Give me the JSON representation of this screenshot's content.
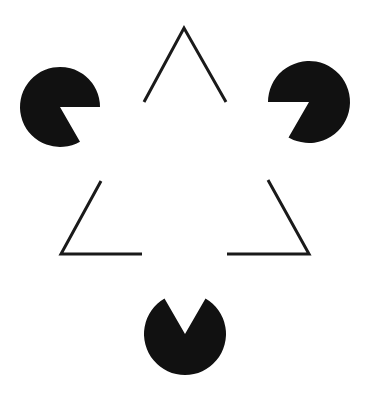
{
  "figure": {
    "background": "#ffffff",
    "foreground": "#111111",
    "pacmen": [
      {
        "name": "left-pacman",
        "cx": 60,
        "cy": 107,
        "r": 40,
        "mouth_start_deg": 0,
        "mouth_end_deg": 60
      },
      {
        "name": "right-pacman",
        "cx": 309,
        "cy": 102,
        "r": 41,
        "mouth_start_deg": 120,
        "mouth_end_deg": 180
      },
      {
        "name": "bottom-pacman",
        "cx": 185,
        "cy": 334,
        "r": 41,
        "mouth_start_deg": 240,
        "mouth_end_deg": 300
      }
    ],
    "outline_corners": [
      {
        "name": "top-corner",
        "points": [
          [
            144,
            102
          ],
          [
            184,
            28
          ],
          [
            226,
            102
          ]
        ]
      },
      {
        "name": "left-corner",
        "points": [
          [
            101,
            181
          ],
          [
            61,
            254
          ],
          [
            142,
            254
          ]
        ]
      },
      {
        "name": "right-corner",
        "points": [
          [
            268,
            180
          ],
          [
            309,
            254
          ],
          [
            227,
            254
          ]
        ]
      }
    ]
  }
}
